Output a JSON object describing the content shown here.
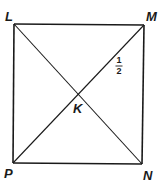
{
  "diagram": {
    "shape": "rectangle",
    "vertices": {
      "L": {
        "label": "L"
      },
      "M": {
        "label": "M"
      },
      "N": {
        "label": "N"
      },
      "P": {
        "label": "P"
      }
    },
    "intersection": {
      "label": "K"
    },
    "angle_marks": [
      {
        "label_numerator": "1",
        "label_denominator": "2",
        "position": "angle 1 near M, below diagonal MP"
      }
    ],
    "segments": [
      "LM",
      "MN",
      "NP",
      "PL",
      "LN",
      "MP"
    ],
    "colors": {
      "stroke": "#1a1a1a",
      "background": "#ffffff"
    }
  }
}
